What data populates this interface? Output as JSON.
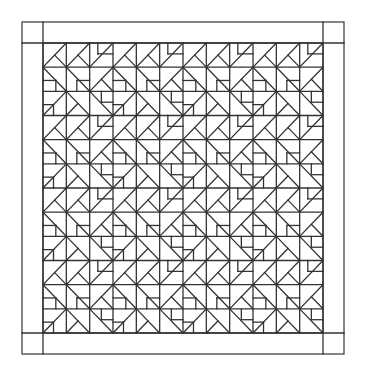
{
  "diagram": {
    "type": "quilt-pattern",
    "colors": {
      "line": "#333333",
      "border": "#444444",
      "background": "#ffffff"
    },
    "outer": {
      "x": 22,
      "y": 22,
      "w": 322,
      "h": 332
    },
    "inner": {
      "x": 43,
      "y": 43,
      "w": 280,
      "h": 290
    },
    "grid": {
      "cols": 12,
      "rows": 12
    },
    "corner_squares": 4,
    "tile": {
      "size": 3,
      "cells": [
        [
          [
            [
              0,
              1,
              1,
              0
            ],
            [
              0.5,
              0.5,
              1,
              1
            ]
          ],
          [
            [
              0,
              1,
              1,
              0
            ],
            [
              0.5,
              0.5,
              1,
              1
            ]
          ],
          [
            [
              0,
              1,
              1,
              0
            ],
            [
              0.35,
              0,
              0.35,
              0.45
            ],
            [
              0.35,
              0.45,
              1,
              0.45
            ]
          ]
        ],
        [
          [
            [
              0,
              0,
              1,
              1
            ],
            [
              0,
              0.55,
              0.55,
              0.55
            ],
            [
              0.55,
              0.55,
              0.55,
              1
            ]
          ],
          [
            [
              0,
              0,
              1,
              1
            ],
            [
              0.45,
              0.55,
              1,
              0.55
            ],
            [
              0.45,
              0.55,
              0.45,
              1
            ]
          ],
          [
            [
              0,
              1,
              1,
              0
            ],
            [
              0.5,
              0.5,
              1,
              1
            ]
          ]
        ],
        [
          [
            [
              0,
              1,
              1,
              0
            ],
            [
              0,
              0.55,
              0.45,
              0.55
            ],
            [
              0.45,
              0.55,
              0.45,
              1
            ]
          ],
          [
            [
              0,
              0,
              1,
              1
            ],
            [
              0,
              1,
              0.5,
              0.5
            ]
          ],
          [
            [
              0,
              0,
              1,
              1
            ],
            [
              0.5,
              0,
              0.5,
              0.45
            ],
            [
              0.5,
              0.45,
              1,
              0.45
            ]
          ]
        ]
      ]
    }
  }
}
